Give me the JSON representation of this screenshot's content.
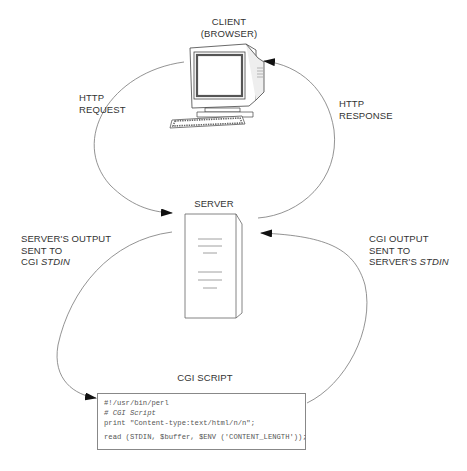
{
  "nodes": {
    "client": {
      "title_line1": "CLIENT",
      "title_line2": "(BROWSER)"
    },
    "server": {
      "title": "SERVER"
    },
    "cgi_script": {
      "title": "CGI SCRIPT"
    }
  },
  "edges": {
    "http_request": {
      "line1": "HTTP",
      "line2": "REQUEST"
    },
    "http_response": {
      "line1": "HTTP",
      "line2": "RESPONSE"
    },
    "server_to_cgi": {
      "line1": "SERVER'S OUTPUT",
      "line2": "SENT TO",
      "line3_prefix": "CGI ",
      "line3_emph": "STDIN"
    },
    "cgi_to_server": {
      "line1": "CGI OUTPUT",
      "line2": "SENT TO",
      "line3_prefix": "SERVER'S ",
      "line3_emph": "STDIN"
    }
  },
  "code": {
    "lines": [
      "#!/usr/bin/perl",
      "# CGI Script",
      "print \"Content-type:text/html/n/n\";",
      "read (STDIN, $buffer, $ENV ('CONTENT_LENGTH'));"
    ]
  },
  "colors": {
    "line": "#777777",
    "arrowhead": "#111111",
    "text": "#333333"
  }
}
